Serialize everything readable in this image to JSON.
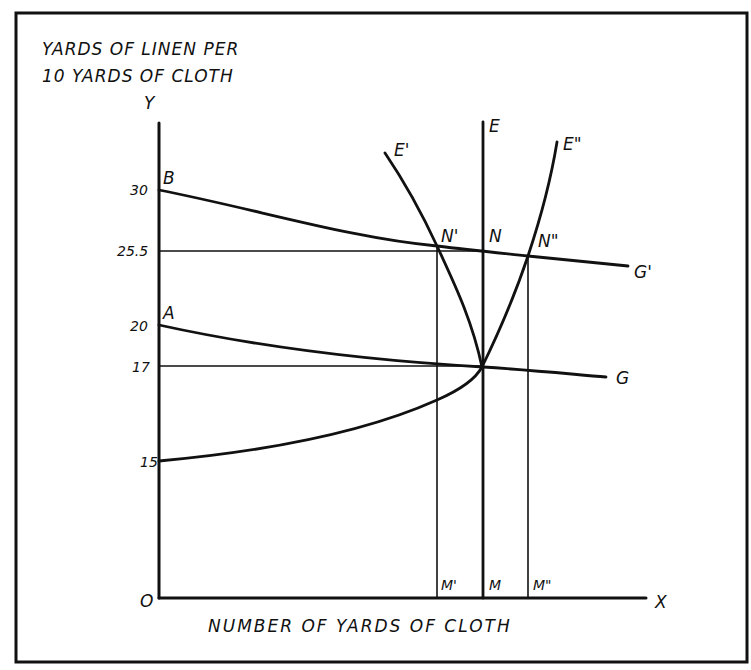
{
  "figure": {
    "y_axis_title_line1": "YARDS OF LINEN PER",
    "y_axis_title_line2": "10 YARDS OF CLOTH",
    "y_axis_label": "Y",
    "x_axis_label": "X",
    "origin_label": "O",
    "x_axis_title": "NUMBER OF YARDS OF CLOTH",
    "colors": {
      "ink": "#111111",
      "background": "#ffffff"
    }
  },
  "y_ticks": [
    {
      "label": "30",
      "value": 30
    },
    {
      "label": "25.5",
      "value": 25.5
    },
    {
      "label": "20",
      "value": 20
    },
    {
      "label": "17",
      "value": 17
    },
    {
      "label": "15",
      "value": 15
    }
  ],
  "point_labels": {
    "B": "B",
    "A": "A",
    "E": "E",
    "E_prime": "E'",
    "E_double_prime": "E\"",
    "N": "N",
    "N_prime": "N'",
    "N_double_prime": "N\"",
    "G": "G",
    "G_prime": "G'",
    "M": "M",
    "M_prime": "M'",
    "M_double_prime": "M\""
  },
  "curves": [
    {
      "name": "AG",
      "description": "Curve from A (20) falling to G, passing the 17-yard equilibrium"
    },
    {
      "name": "BG'",
      "description": "Curve from B (30) falling to G', passing through N', N, N''"
    },
    {
      "name": "E",
      "description": "Vertical supply line at M"
    },
    {
      "name": "E'",
      "description": "Curve falling from E' to the equilibrium at 17"
    },
    {
      "name": "E''",
      "description": "Curve rising from 15 on the Y axis through equilibrium to E''"
    }
  ]
}
